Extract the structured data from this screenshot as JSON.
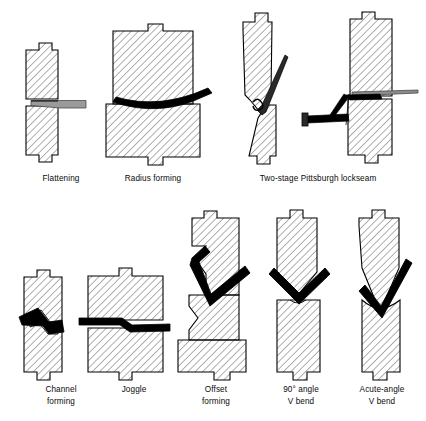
{
  "figure": {
    "colors": {
      "outline": "#000000",
      "hatch": "#1a1a1a",
      "fill": "#ffffff",
      "workpiece_black": "#000000",
      "workpiece_gray": "#808080",
      "background": "#ffffff",
      "caption": "#0a0a0a"
    },
    "hatch": {
      "angle_deg": 45,
      "spacing_px": 5.2,
      "line_width_px": 0.7
    }
  },
  "rows": [
    {
      "name": "top-row",
      "operations": [
        {
          "id": "flattening",
          "label": "Flattening",
          "label_lines": [
            "Flattening"
          ],
          "caption_x": 61,
          "caption_y": 181,
          "punch_type": "flat",
          "die_type": "flat",
          "workpiece": "thin-flat-strip",
          "workpiece_color": "#808080"
        },
        {
          "id": "radius-forming",
          "label": "Radius forming",
          "label_lines": [
            "Radius forming"
          ],
          "caption_x": 153,
          "caption_y": 181,
          "punch_type": "flat-wide",
          "die_type": "flat-wide",
          "workpiece": "curved-arc-strip",
          "workpiece_color": "#000000"
        },
        {
          "id": "two-stage-pittsburgh-lockseam",
          "label": "Two-stage Pittsburgh lockseam",
          "label_lines": [
            "Two-stage Pittsburgh lockseam"
          ],
          "caption_x": 318,
          "caption_y": 181,
          "punch_type": "pointed-pair",
          "die_type": "angled-pair",
          "workpiece": "lockseam-hook",
          "workpiece_color": "#000000",
          "stages": 2
        }
      ]
    },
    {
      "name": "bottom-row",
      "operations": [
        {
          "id": "channel-forming",
          "label": "Channel forming",
          "label_lines": [
            "Channel",
            "forming"
          ],
          "caption_x": 61,
          "caption_y": 392,
          "punch_type": "channel",
          "die_type": "channel",
          "workpiece": "stepped-channel",
          "workpiece_color": "#000000"
        },
        {
          "id": "joggle",
          "label": "Joggle",
          "label_lines": [
            "Joggle"
          ],
          "caption_x": 134,
          "caption_y": 392,
          "punch_type": "joggle",
          "die_type": "joggle",
          "workpiece": "offset-step-strip",
          "workpiece_color": "#000000"
        },
        {
          "id": "offset-forming",
          "label": "Offset forming",
          "label_lines": [
            "Offset",
            "forming"
          ],
          "caption_x": 216,
          "caption_y": 392,
          "punch_type": "offset-z",
          "die_type": "offset-z",
          "workpiece": "z-bend",
          "workpiece_color": "#000000"
        },
        {
          "id": "ninety-degree-angle-v-bend",
          "label": "90° angle V bend",
          "label_lines": [
            "90° angle",
            "V bend"
          ],
          "caption_x": 301,
          "caption_y": 392,
          "punch_type": "v-punch-90",
          "die_type": "v-die-90",
          "workpiece": "v-bend-90",
          "workpiece_color": "#000000",
          "angle_deg": 90
        },
        {
          "id": "acute-angle-v-bend",
          "label": "Acute-angle V bend",
          "label_lines": [
            "Acute-angle",
            "V bend"
          ],
          "caption_x": 382,
          "caption_y": 392,
          "punch_type": "v-punch-acute",
          "die_type": "v-die-acute",
          "workpiece": "v-bend-acute",
          "workpiece_color": "#000000",
          "angle_deg": 45
        }
      ]
    }
  ]
}
